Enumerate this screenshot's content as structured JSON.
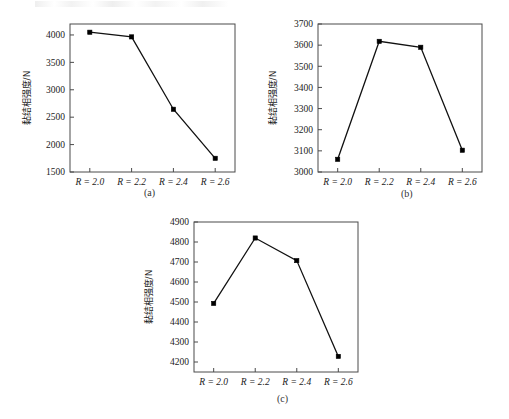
{
  "figure": {
    "background": "#ffffff",
    "line_color": "#111111",
    "marker_color": "#000000",
    "frame_color": "#4a4a4a"
  },
  "chart_data": [
    {
      "type": "line",
      "panel_label": "(a)",
      "title": "",
      "xlabel": "",
      "ylabel": "黏结相强度/N",
      "categories": [
        "R = 2.0",
        "R = 2.2",
        "R = 2.4",
        "R = 2.6"
      ],
      "values": [
        4050,
        3965,
        2645,
        1750
      ],
      "ylim": [
        1500,
        4200
      ],
      "yticks": [
        1500,
        2000,
        2500,
        3000,
        3500,
        4000
      ],
      "ytick_labels": [
        "1500",
        "2000",
        "2500",
        "3000",
        "3500",
        "4000"
      ],
      "grid": false,
      "legend": "none",
      "marker": "square"
    },
    {
      "type": "line",
      "panel_label": "(b)",
      "title": "",
      "xlabel": "",
      "ylabel": "黏结相强度/N",
      "categories": [
        "R = 2.0",
        "R = 2.2",
        "R = 2.4",
        "R = 2.6"
      ],
      "values": [
        3060,
        3618,
        3590,
        3103
      ],
      "ylim": [
        3000,
        3700
      ],
      "yticks": [
        3000,
        3100,
        3200,
        3300,
        3400,
        3500,
        3600,
        3700
      ],
      "ytick_labels": [
        "3000",
        "3100",
        "3200",
        "3300",
        "3400",
        "3500",
        "3600",
        "3700"
      ],
      "grid": false,
      "legend": "none",
      "marker": "square"
    },
    {
      "type": "line",
      "panel_label": "(c)",
      "title": "",
      "xlabel": "",
      "ylabel": "黏结相强度/N",
      "categories": [
        "R = 2.0",
        "R = 2.2",
        "R = 2.4",
        "R = 2.6"
      ],
      "values": [
        4493,
        4820,
        4707,
        4228
      ],
      "ylim": [
        4150,
        4900
      ],
      "yticks": [
        4200,
        4300,
        4400,
        4500,
        4600,
        4700,
        4800,
        4900
      ],
      "ytick_labels": [
        "4200",
        "4300",
        "4400",
        "4500",
        "4600",
        "4700",
        "4800",
        "4900"
      ],
      "grid": false,
      "legend": "none",
      "marker": "square"
    }
  ]
}
